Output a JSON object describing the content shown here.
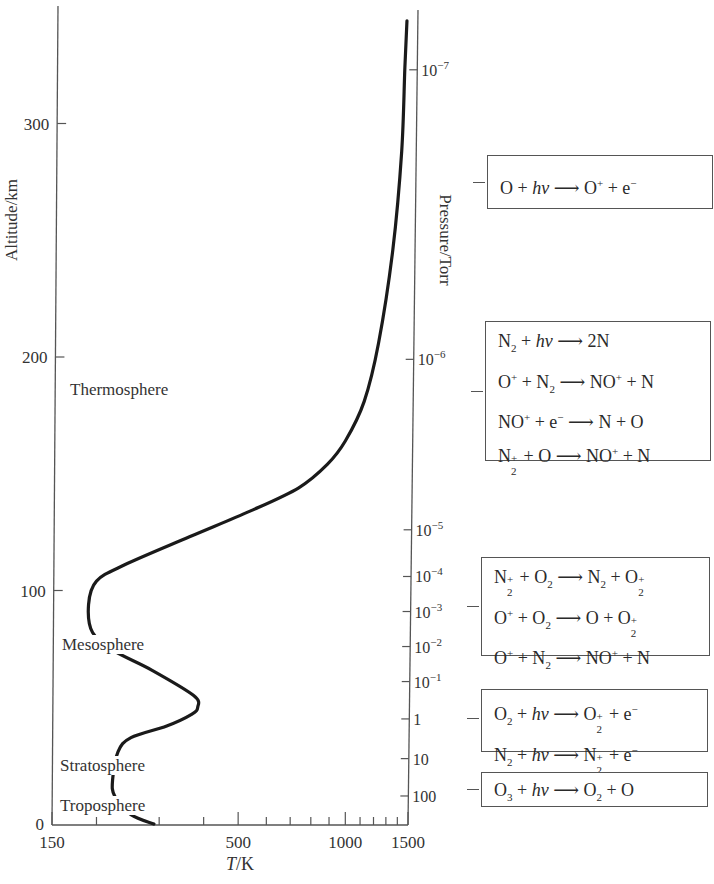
{
  "chart_data": {
    "type": "line",
    "title": "",
    "xlabel": "T/K",
    "ylabel": "Altitude/km",
    "y2label": "Pressure/Torr",
    "xscale": "log",
    "xlim": [
      150,
      1500
    ],
    "ylim": [
      0,
      350
    ],
    "x_ticks": [
      "150",
      "500",
      "1000",
      "1500"
    ],
    "x_minor_ticks": [
      200,
      300,
      400,
      600,
      700,
      800,
      900,
      1100,
      1200,
      1300,
      1400
    ],
    "y_ticks": [
      "0",
      "100",
      "200",
      "300"
    ],
    "y2_ticks": [
      {
        "label": "10",
        "exp": "−7",
        "altitude": 323
      },
      {
        "label": "10",
        "exp": "−6",
        "altitude": 199
      },
      {
        "label": "10",
        "exp": "−5",
        "altitude": 126
      },
      {
        "label": "10",
        "exp": "−4",
        "altitude": 106
      },
      {
        "label": "10",
        "exp": "−3",
        "altitude": 91
      },
      {
        "label": "10",
        "exp": "−2",
        "altitude": 76
      },
      {
        "label": "10",
        "exp": "−1",
        "altitude": 61
      },
      {
        "label": "1",
        "exp": "",
        "altitude": 45
      },
      {
        "label": "10",
        "exp": "",
        "altitude": 28
      },
      {
        "label": "100",
        "exp": "",
        "altitude": 12
      }
    ],
    "series": [
      {
        "name": "Temperature profile",
        "points": [
          {
            "T": 290,
            "alt": 0
          },
          {
            "T": 250,
            "alt": 4
          },
          {
            "T": 225,
            "alt": 12
          },
          {
            "T": 222,
            "alt": 19
          },
          {
            "T": 230,
            "alt": 31
          },
          {
            "T": 250,
            "alt": 37
          },
          {
            "T": 315,
            "alt": 42
          },
          {
            "T": 370,
            "alt": 47
          },
          {
            "T": 385,
            "alt": 50
          },
          {
            "T": 375,
            "alt": 55
          },
          {
            "T": 285,
            "alt": 66
          },
          {
            "T": 225,
            "alt": 74
          },
          {
            "T": 195,
            "alt": 82
          },
          {
            "T": 190,
            "alt": 94
          },
          {
            "T": 200,
            "alt": 104
          },
          {
            "T": 240,
            "alt": 111
          },
          {
            "T": 365,
            "alt": 123
          },
          {
            "T": 540,
            "alt": 134
          },
          {
            "T": 740,
            "alt": 144
          },
          {
            "T": 890,
            "alt": 154
          },
          {
            "T": 1000,
            "alt": 164
          },
          {
            "T": 1130,
            "alt": 181
          },
          {
            "T": 1240,
            "alt": 206
          },
          {
            "T": 1360,
            "alt": 246
          },
          {
            "T": 1440,
            "alt": 288
          },
          {
            "T": 1470,
            "alt": 324
          },
          {
            "T": 1490,
            "alt": 344
          }
        ]
      }
    ],
    "annotations": [
      {
        "text": "Thermosphere",
        "alt": 185
      },
      {
        "text": "Mesosphere",
        "alt": 76
      },
      {
        "text": "Stratosphere",
        "alt": 25
      },
      {
        "text": "Troposphere",
        "alt": 8
      }
    ]
  },
  "reaction_boxes": [
    {
      "lines": [
        [
          {
            "t": "O + "
          },
          {
            "i": "hν"
          },
          {
            "t": " ⟶ O"
          },
          {
            "sup": "+"
          },
          {
            "t": " + e"
          },
          {
            "sup": "−"
          }
        ]
      ]
    },
    {
      "lines": [
        [
          {
            "t": "N"
          },
          {
            "sub": "2"
          },
          {
            "t": " + "
          },
          {
            "i": "hν"
          },
          {
            "t": " ⟶ 2N"
          }
        ],
        [
          {
            "t": "O"
          },
          {
            "sup": "+"
          },
          {
            "t": " + N"
          },
          {
            "sub": "2"
          },
          {
            "t": " ⟶ NO"
          },
          {
            "sup": "+"
          },
          {
            "t": " + N"
          }
        ],
        [
          {
            "t": "NO"
          },
          {
            "sup": "+"
          },
          {
            "t": " + e"
          },
          {
            "sup": "−"
          },
          {
            "t": " ⟶ N + O"
          }
        ],
        [
          {
            "t": "N"
          },
          {
            "subsup": [
              "2",
              "+"
            ]
          },
          {
            "t": " + O ⟶ NO"
          },
          {
            "sup": "+"
          },
          {
            "t": " + N"
          }
        ]
      ]
    },
    {
      "lines": [
        [
          {
            "t": "N"
          },
          {
            "subsup": [
              "2",
              "+"
            ]
          },
          {
            "t": " + O"
          },
          {
            "sub": "2"
          },
          {
            "t": " ⟶ N"
          },
          {
            "sub": "2"
          },
          {
            "t": " + O"
          },
          {
            "subsup": [
              "2",
              "+"
            ]
          }
        ],
        [
          {
            "t": "O"
          },
          {
            "sup": "+"
          },
          {
            "t": " + O"
          },
          {
            "sub": "2"
          },
          {
            "t": " ⟶ O + O"
          },
          {
            "subsup": [
              "2",
              "+"
            ]
          }
        ],
        [
          {
            "t": "O"
          },
          {
            "sup": "+"
          },
          {
            "t": " + N"
          },
          {
            "sub": "2"
          },
          {
            "t": " ⟶ NO"
          },
          {
            "sup": "+"
          },
          {
            "t": " + N"
          }
        ]
      ]
    },
    {
      "lines": [
        [
          {
            "t": "O"
          },
          {
            "sub": "2"
          },
          {
            "t": " + "
          },
          {
            "i": "hν"
          },
          {
            "t": " ⟶ O"
          },
          {
            "subsup": [
              "2",
              "+"
            ]
          },
          {
            "t": " + e"
          },
          {
            "sup": "−"
          }
        ],
        [
          {
            "t": "N"
          },
          {
            "sub": "2"
          },
          {
            "t": " + "
          },
          {
            "i": "hν"
          },
          {
            "t": " ⟶ N"
          },
          {
            "subsup": [
              "2",
              "+"
            ]
          },
          {
            "t": " + e"
          },
          {
            "sup": "−"
          }
        ]
      ]
    },
    {
      "lines": [
        [
          {
            "t": "O"
          },
          {
            "sub": "3"
          },
          {
            "t": " + "
          },
          {
            "i": "hν"
          },
          {
            "t": " ⟶ O"
          },
          {
            "sub": "2"
          },
          {
            "t": " + O"
          }
        ]
      ]
    }
  ]
}
